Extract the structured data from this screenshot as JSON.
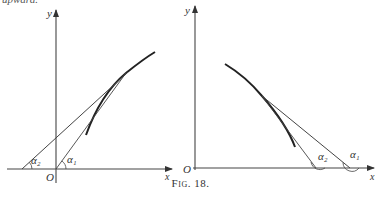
{
  "top_fragment": "upward.",
  "caption": "Fig. 18.",
  "left_panel": {
    "y_label": "y",
    "x_label": "x",
    "origin_label": "O",
    "angle_labels": [
      "α₂",
      "α₁"
    ]
  },
  "right_panel": {
    "y_label": "y",
    "x_label": "x",
    "origin_label": "O",
    "angle_labels": [
      "α₂",
      "α₁"
    ]
  },
  "colors": {
    "ink": "#333333",
    "background": "#ffffff"
  }
}
